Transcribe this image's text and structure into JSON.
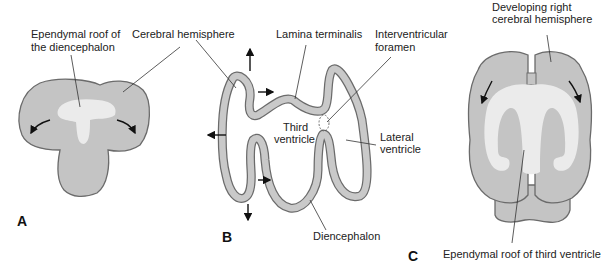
{
  "colors": {
    "tissue": "#c4c4c4",
    "outline": "#6b6b6b",
    "ependyma": "#ebebeb",
    "text": "#222222"
  },
  "panels": {
    "a": {
      "label": "A",
      "annotations": {
        "ependymal_roof_line1": "Ependymal roof of",
        "ependymal_roof_line2": "the diencephalon"
      }
    },
    "b": {
      "label": "B",
      "annotations": {
        "cerebral_hemisphere": "Cerebral hemisphere",
        "lamina_terminalis": "Lamina terminalis",
        "interventricular_line1": "Interventricular",
        "interventricular_line2": "foramen",
        "third_ventricle_line1": "Third",
        "third_ventricle_line2": "ventricle",
        "lateral_ventricle_line1": "Lateral",
        "lateral_ventricle_line2": "ventricle",
        "diencephalon": "Diencephalon"
      }
    },
    "c": {
      "label": "C",
      "annotations": {
        "developing_line1": "Developing right",
        "developing_line2": "cerebral hemisphere",
        "ependymal_roof_third": "Ependymal roof of third ventricle"
      }
    }
  }
}
